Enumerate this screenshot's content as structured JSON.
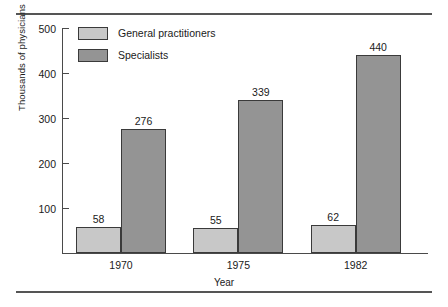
{
  "chart_data": {
    "type": "bar",
    "title": "",
    "subtitle": "",
    "xlabel": "Year",
    "ylabel": "Thousands of physicians",
    "categories": [
      "1970",
      "1975",
      "1982"
    ],
    "series": [
      {
        "name": "General practitioners",
        "color": "#c8c8c8",
        "values": [
          58,
          55,
          62
        ],
        "labels": [
          "58",
          "55",
          "62"
        ]
      },
      {
        "name": "Specialists",
        "color": "#949494",
        "values": [
          276,
          339,
          440
        ],
        "labels": [
          "276",
          "339",
          "440"
        ]
      }
    ],
    "ylim": [
      0,
      500
    ],
    "yticks": [
      0,
      100,
      200,
      300,
      400,
      500
    ],
    "ytick_labels": [
      "",
      "100",
      "200",
      "300",
      "400",
      "500"
    ],
    "grid": false,
    "legend_position": "upper-left-inside",
    "bar_outline_color": "#3a3a3a",
    "axis_color": "#4a4a4a",
    "rule_color": "#555555"
  },
  "legend": {
    "entries": [
      {
        "label": "General practitioners"
      },
      {
        "label": "Specialists"
      }
    ]
  },
  "axes": {
    "y_title": "Thousands of physicians",
    "x_title": "Year",
    "y_tick_labels": [
      "500",
      "400",
      "300",
      "200",
      "100"
    ]
  }
}
